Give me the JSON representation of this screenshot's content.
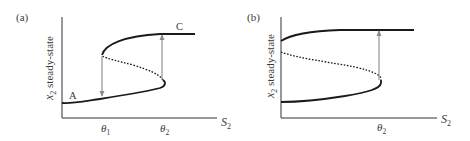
{
  "figure": {
    "panels": [
      {
        "id": "a",
        "label": "(a)",
        "ylabel_var": "x",
        "ylabel_sub": "2",
        "ylabel_text": " steady-state",
        "xlabel_var": "S",
        "xlabel_sub": "2",
        "ticks": [
          {
            "var": "θ",
            "sub": "1"
          },
          {
            "var": "θ",
            "sub": "2"
          }
        ],
        "point_labels": {
          "A": "A",
          "C": "C"
        },
        "branches": [
          "stable lower",
          "unstable middle (dashed)",
          "stable upper"
        ],
        "transitions": [
          "jump down at θ1",
          "jump up at θ2"
        ]
      },
      {
        "id": "b",
        "label": "(b)",
        "ylabel_var": "x",
        "ylabel_sub": "2",
        "ylabel_text": " steady-state",
        "xlabel_var": "S",
        "xlabel_sub": "2",
        "ticks": [
          {
            "var": "θ",
            "sub": "2"
          }
        ],
        "branches": [
          "stable lower",
          "unstable middle (dashed)",
          "stable upper"
        ],
        "transitions": [
          "jump up at θ2"
        ]
      }
    ],
    "colors": {
      "curve": "#1a1a1a",
      "axis": "#333333",
      "arrow": "#8a8a8a",
      "text": "#3a3a3a"
    }
  }
}
